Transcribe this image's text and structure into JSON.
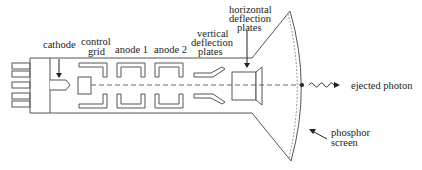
{
  "diagram": {
    "labels": {
      "cathode": "cathode",
      "control_grid_1": "control",
      "control_grid_2": "grid",
      "anode1": "anode 1",
      "anode2": "anode 2",
      "vertical_1": "vertical",
      "vertical_2": "deflection",
      "vertical_3": "plates",
      "horizontal_1": "horizontal",
      "horizontal_2": "deflection",
      "horizontal_3": "plates",
      "photon": "ejected photon",
      "phosphor_1": "phosphor",
      "phosphor_2": "screen"
    },
    "colors": {
      "line": "#555555",
      "text": "#222222",
      "background": "#ffffff"
    }
  }
}
